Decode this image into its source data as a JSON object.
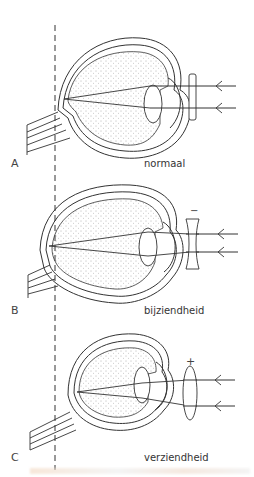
{
  "diagram": {
    "panels": [
      {
        "id": "A",
        "letter": "A",
        "caption": "normaal",
        "lens": "flat",
        "lens_sign": ""
      },
      {
        "id": "B",
        "letter": "B",
        "caption": "bijziendheid",
        "lens": "concave",
        "lens_sign": "−"
      },
      {
        "id": "C",
        "letter": "C",
        "caption": "verziendheid",
        "lens": "convex",
        "lens_sign": "+"
      }
    ],
    "reference_line": "dashed vertical line through retina position",
    "colors": {
      "stroke": "#333333",
      "background": "#ffffff"
    }
  }
}
